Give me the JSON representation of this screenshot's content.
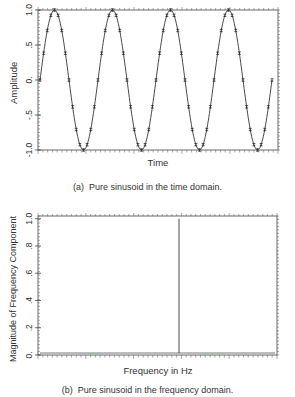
{
  "chart_data": [
    {
      "type": "line",
      "title": "",
      "caption": "(a)  Pure sinusoid in the time domain.",
      "xlabel": "Time",
      "ylabel": "Amplitude",
      "ylim": [
        -1.0,
        1.0
      ],
      "yticks": [
        "-1.0",
        "-.5",
        "0.",
        ".5",
        "1.0"
      ],
      "ytick_values": [
        -1.0,
        -0.5,
        0.0,
        0.5,
        1.0
      ],
      "xticks_labeled": false,
      "grid": false,
      "series": [
        {
          "name": "sinusoid",
          "cycles": 4,
          "samples_per_cycle": 16,
          "amplitude": 1.0,
          "markers": "sample points",
          "description": "Sine wave starting at 0, 4 full cycles, sampled 16 times per cycle"
        }
      ]
    },
    {
      "type": "bar",
      "title": "",
      "caption": "(b)  Pure sinusoid in the frequency domain.",
      "xlabel": "Frequency in Hz",
      "ylabel": "Magnitude of Frequency Component",
      "ylim": [
        0,
        1.0
      ],
      "yticks": [
        "0.",
        ".2",
        ".4",
        ".6",
        ".8",
        "1.0"
      ],
      "ytick_values": [
        0,
        0.2,
        0.4,
        0.6,
        0.8,
        1.0
      ],
      "xticks_labeled": false,
      "grid": false,
      "series": [
        {
          "name": "spectrum",
          "spike_position_fraction": 0.59,
          "spike_magnitude": 1.0,
          "baseline": 0.0,
          "description": "Single spike of magnitude 1.0 at the sinusoid frequency; all other components 0"
        }
      ]
    }
  ],
  "panels": {
    "top": {
      "caption_prefix": "(a)",
      "caption_text": "Pure sinusoid in the time domain.",
      "xlabel": "Time",
      "ylabel": "Amplitude"
    },
    "bottom": {
      "caption_prefix": "(b)",
      "caption_text": "Pure sinusoid in the frequency domain.",
      "xlabel": "Frequency in Hz",
      "ylabel": "Magnitude of Frequency Component"
    }
  }
}
